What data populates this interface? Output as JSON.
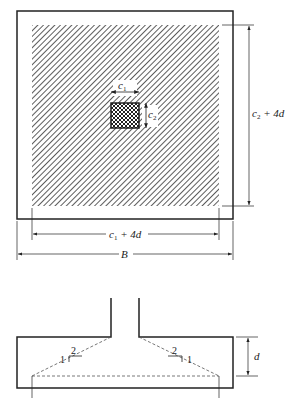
{
  "plan_view": {
    "dimensions": {
      "c1_label": "c",
      "c1_sub": "1",
      "c2_label": "c",
      "c2_sub": "2",
      "width_critical": {
        "var": "c",
        "sub": "1",
        "rest": " + 4d"
      },
      "height_critical": {
        "var": "c",
        "sub": "2",
        "rest": " + 4d"
      },
      "footing_width": "B"
    }
  },
  "section_view": {
    "slope_left": {
      "run": "2",
      "rise": "1"
    },
    "slope_right": {
      "run": "2",
      "rise": "1"
    },
    "depth_label": "d"
  },
  "colors": {
    "line": "#222222",
    "dash": "#555555",
    "background": "#ffffff"
  }
}
